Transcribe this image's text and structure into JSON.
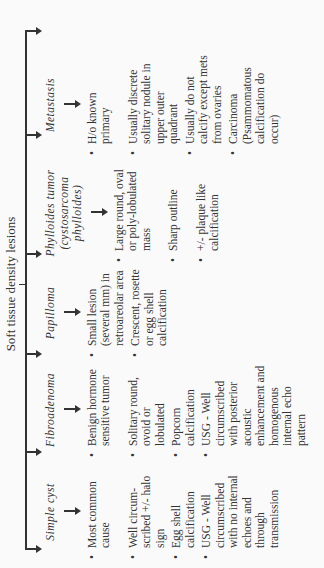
{
  "diagram": {
    "title": "Soft tissue density lesions",
    "columns": [
      {
        "heading": "Simple cyst",
        "items": [
          "Most common cause",
          "Well circum-scribed +/- halo sign",
          "Egg shell calcification",
          "USG - Well circumscribed with no internal echoes and through transmission"
        ]
      },
      {
        "heading": "Fibroadenoma",
        "items": [
          "Benign hormone sensitive tumor",
          "Solitary round, ovoid or lobulated",
          "Popcorn calcification",
          "USG - Well circumscribed with posterior acoustic enhancement and homogenous internal echo pattern"
        ]
      },
      {
        "heading": "Papilloma",
        "items": [
          "Small lesion (several mm) in retroareolar area",
          "Crescent, rosette or egg shell calcification"
        ]
      },
      {
        "heading": "Phylloides tumor (cystosarcoma phylloides)",
        "items": [
          "Large round, oval or poly-lobulated mass",
          "Sharp outline",
          "+/- plaque like calcification"
        ]
      },
      {
        "heading": "Metastasis",
        "items": [
          "H/o known primary",
          "Usually discrete solitary nodule in upper outer quadrant",
          "Usually do not calcify except mets from ovaries",
          "Carcinoma (Psammomatous calcification do occur)"
        ]
      },
      {
        "heading": "Circumscribed malignant lesion",
        "items": [
          "Usually less well circumscribed, with less sharply defined margin, as compared to benign lesions",
          "Typically high soft tissue density"
        ]
      }
    ]
  }
}
